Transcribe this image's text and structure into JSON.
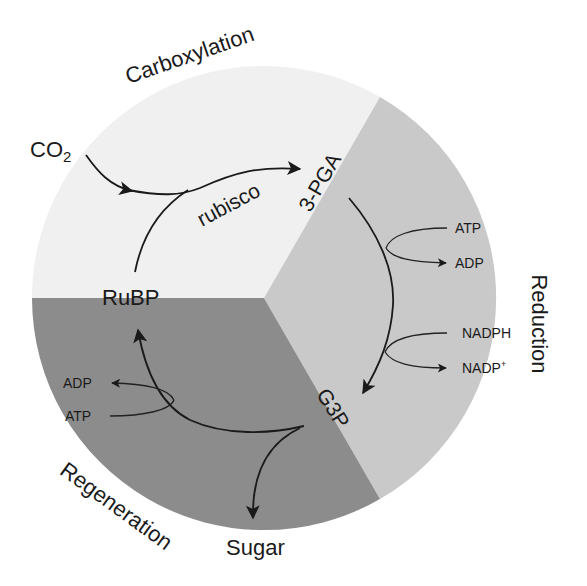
{
  "colors": {
    "carboxylation_sector": "#f0f0f0",
    "reduction_sector": "#c9c9c9",
    "regeneration_sector": "#8c8c8c",
    "text": "#1a1a1a"
  },
  "phases": {
    "carboxylation": "Carboxylation",
    "reduction": "Reduction",
    "regeneration": "Regeneration"
  },
  "molecules": {
    "co2_main": "CO",
    "co2_sub": "2",
    "rubp": "RuBP",
    "pga": "3-PGA",
    "g3p": "G3P",
    "sugar": "Sugar"
  },
  "enzymes": {
    "rubisco": "rubisco"
  },
  "reduction_inputs": {
    "atp": "ATP",
    "adp": "ADP",
    "nadph": "NADPH",
    "nadp_main": "NADP",
    "nadp_sup": "+"
  },
  "regeneration_inputs": {
    "atp": "ATP",
    "adp": "ADP"
  }
}
